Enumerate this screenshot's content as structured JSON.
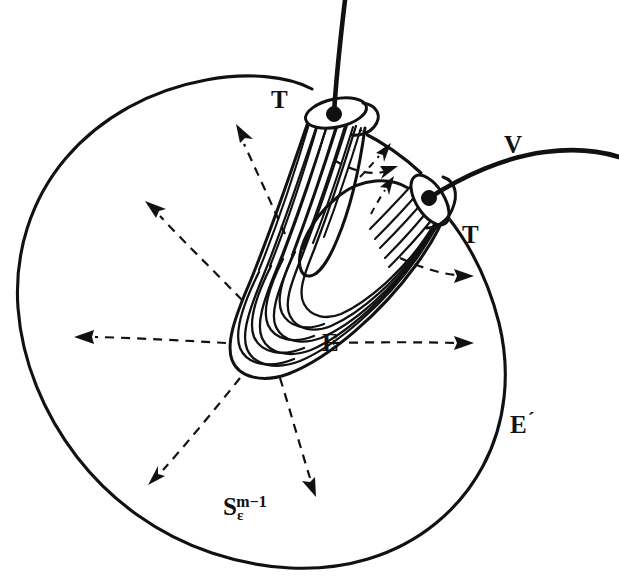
{
  "figure": {
    "kind": "mathematical-diagram",
    "caption_title": "Vector field V transverse to epsilon-sphere with bent tube E",
    "background_color": "#ffffff",
    "ink_color": "#111111"
  },
  "labels": {
    "tube_upper": "T",
    "tube_right": "T",
    "tube_body": "E",
    "exterior_region": "E",
    "exterior_prime_mark": "´",
    "vector_field": "V",
    "sphere_base": "S",
    "sphere_subscript": "ε",
    "sphere_superscript": "m−1"
  },
  "geometry": {
    "sphere": {
      "center_x": 262,
      "center_y": 343,
      "radius_x": 246,
      "radius_y": 216,
      "stroke_width": 3.1
    },
    "tube_upper": {
      "cap_center_x": 336,
      "cap_center_y": 113,
      "cap_rx": 30,
      "cap_ry": 13,
      "rib_count": 11,
      "entry_dot_x": 334,
      "entry_dot_y": 114,
      "entry_dot_r": 7
    },
    "tube_right": {
      "cap_center_x": 430,
      "cap_center_y": 200,
      "cap_rx": 26,
      "cap_ry": 13,
      "rib_count": 9,
      "entry_dot_x": 429,
      "entry_dot_y": 198,
      "entry_dot_r": 7
    },
    "bend": {
      "apex_x": 243,
      "apex_y": 352,
      "nested_curve_count": 6
    }
  },
  "flow_lines": {
    "description": "dashed integral curves of the vector field radiating outward from the bend region",
    "count": 9,
    "dash_pattern": "9 7",
    "arrow_directions": [
      "left",
      "up-left",
      "up",
      "up-right-inner",
      "up-right-inner-2",
      "right-upper",
      "right-lower",
      "down",
      "down-left"
    ]
  }
}
